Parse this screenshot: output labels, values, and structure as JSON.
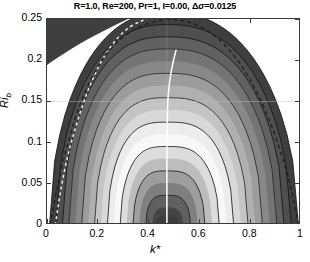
{
  "figure": {
    "title_plain": "R=1.0, Re=200, Pr=1, I=0.00, Δσ=0.0125",
    "xtitle": "k*",
    "ytitle_base": "Ri",
    "ytitle_sub": "b"
  },
  "chart_data": {
    "type": "contour",
    "title": "R=1.0, Re=200, Pr=1, I=0.00, Δσ=0.0125",
    "xlabel": "k*",
    "ylabel": "Ri_b",
    "xlim": [
      0,
      1
    ],
    "ylim": [
      0,
      0.25
    ],
    "xticks": [
      0,
      0.2,
      0.4,
      0.6,
      0.8,
      1
    ],
    "xticklabels": [
      "0",
      "0.2",
      "0.4",
      "0.6",
      "0.8",
      "1"
    ],
    "yticks": [
      0,
      0.05,
      0.1,
      0.15,
      0.2,
      0.25
    ],
    "yticklabels": [
      "0",
      "0.05",
      "0.1",
      "0.15",
      "0.2",
      "0.25"
    ],
    "grid": true,
    "gridlines_y": [
      0.15
    ],
    "colormap": "cyclic-grayscale",
    "contour_interval": 0.0125,
    "contour_interval_symbol": "Δσ",
    "parameters": {
      "R": 1.0,
      "Re": 200,
      "Pr": 1,
      "I": 0.0,
      "delta_sigma": 0.0125
    },
    "neutral_curve": {
      "name": "neutral stability boundary",
      "style": "dashed",
      "color": "#1a1a1a",
      "points": [
        [
          0.012,
          0.0
        ],
        [
          0.03,
          0.03
        ],
        [
          0.052,
          0.062
        ],
        [
          0.08,
          0.098
        ],
        [
          0.115,
          0.134
        ],
        [
          0.16,
          0.17
        ],
        [
          0.215,
          0.201
        ],
        [
          0.28,
          0.224
        ],
        [
          0.355,
          0.24
        ],
        [
          0.43,
          0.248
        ],
        [
          0.5,
          0.25
        ],
        [
          0.57,
          0.246
        ],
        [
          0.64,
          0.235
        ],
        [
          0.71,
          0.216
        ],
        [
          0.775,
          0.19
        ],
        [
          0.835,
          0.157
        ],
        [
          0.888,
          0.118
        ],
        [
          0.932,
          0.078
        ],
        [
          0.966,
          0.04
        ],
        [
          0.99,
          0.0
        ]
      ]
    },
    "inner_white_dashed_curve": {
      "name": "inner dashed boundary",
      "style": "dashed",
      "color": "#f2f2f2",
      "points": [
        [
          0.033,
          0.0
        ],
        [
          0.046,
          0.028
        ],
        [
          0.062,
          0.056
        ],
        [
          0.082,
          0.085
        ],
        [
          0.107,
          0.113
        ],
        [
          0.137,
          0.143
        ],
        [
          0.172,
          0.172
        ],
        [
          0.213,
          0.199
        ],
        [
          0.258,
          0.22
        ],
        [
          0.305,
          0.236
        ],
        [
          0.35,
          0.245
        ],
        [
          0.392,
          0.25
        ]
      ]
    },
    "max_growth_ridge": {
      "name": "fastest growing wavenumber locus",
      "style": "solid",
      "color": "#ffffff",
      "points": [
        [
          0.472,
          0.0
        ],
        [
          0.472,
          0.04
        ],
        [
          0.472,
          0.08
        ],
        [
          0.473,
          0.115
        ],
        [
          0.474,
          0.14
        ],
        [
          0.478,
          0.162
        ],
        [
          0.486,
          0.182
        ],
        [
          0.498,
          0.2
        ],
        [
          0.508,
          0.212
        ]
      ]
    },
    "contour_levels": [
      0.0125,
      0.025,
      0.0375,
      0.05,
      0.0625,
      0.075,
      0.0875,
      0.1,
      0.1125,
      0.125,
      0.1375,
      0.15,
      0.1625,
      0.175,
      0.1875,
      0.2
    ],
    "band_fill_colors": [
      "#3f3f3f",
      "#4f4f4f",
      "#616161",
      "#747474",
      "#888888",
      "#9c9c9c",
      "#b0b0b0",
      "#c4c4c4",
      "#d8d8d8",
      "#ececec",
      "#f8f8f8",
      "#dcdcdc",
      "#bdbdbd",
      "#9e9e9e",
      "#7f7f7f",
      "#606060",
      "#454545"
    ],
    "upper_left_lobe": {
      "name": "secondary dark lobe",
      "fill": "#3f3f3f",
      "region": "upper-left corner, k* in [0, 0.32], Ri_b above 0.205"
    }
  }
}
